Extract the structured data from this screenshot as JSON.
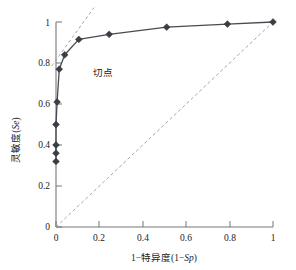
{
  "chart_data": {
    "type": "line",
    "title": "",
    "xlabel": "1−特异度(1−Sp)",
    "ylabel": "灵敏度(Se)",
    "xlabel_parts": {
      "prefix": "1−特异度(1−",
      "italic": "Sp",
      "suffix": ")"
    },
    "ylabel_parts": {
      "prefix": "灵敏度(",
      "italic": "Se",
      "suffix": ")"
    },
    "xlim": [
      0,
      1
    ],
    "ylim": [
      0,
      1
    ],
    "xticks": [
      0,
      0.2,
      0.4,
      0.6,
      0.8,
      1
    ],
    "xtick_labels": [
      "0",
      "0.2",
      "0.4",
      "0.6",
      "0.8",
      "1"
    ],
    "yticks": [
      0,
      0.2,
      0.4,
      0.6,
      0.8,
      1
    ],
    "ytick_labels": [
      "0",
      "0.2",
      "0.4",
      "0.6",
      "0.8",
      "1"
    ],
    "grid": false,
    "legend": "none",
    "series": [
      {
        "name": "ROC curve",
        "style": "solid-with-diamond-markers",
        "color": "#3d3d46",
        "x": [
          0.0,
          0.0,
          0.0,
          0.0,
          0.005,
          0.015,
          0.04,
          0.105,
          0.245,
          0.51,
          0.79,
          1.0
        ],
        "y": [
          0.32,
          0.36,
          0.4,
          0.5,
          0.61,
          0.77,
          0.84,
          0.915,
          0.94,
          0.975,
          0.99,
          1.0
        ]
      },
      {
        "name": "Reference diagonal",
        "style": "dashed",
        "color": "#9a9aa2",
        "x": [
          0.0,
          1.0
        ],
        "y": [
          0.0,
          1.0
        ]
      },
      {
        "name": "Tangent line",
        "style": "dashed",
        "color": "#9a9aa2",
        "x": [
          -0.02,
          0.175
        ],
        "y": [
          0.785,
          1.07
        ]
      }
    ],
    "annotations": [
      {
        "text": "切点",
        "x": 0.135,
        "y": 0.825,
        "points_to": [
          0.04,
          0.84
        ]
      }
    ]
  }
}
